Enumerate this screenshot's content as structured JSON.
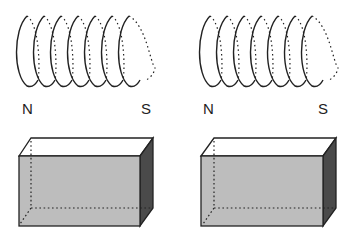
{
  "diagram": {
    "panels": [
      {
        "coil": {
          "turns": 7,
          "label_left": "N",
          "label_right": "S"
        },
        "block": {
          "kind": "rectangular-prism"
        }
      },
      {
        "coil": {
          "turns": 7,
          "label_left": "N",
          "label_right": "S"
        },
        "block": {
          "kind": "rectangular-prism"
        }
      }
    ],
    "colors": {
      "line": "#222222",
      "front_face": "#bdbdbd",
      "top_face": "#ffffff",
      "side_face": "#4a4a4a"
    }
  }
}
